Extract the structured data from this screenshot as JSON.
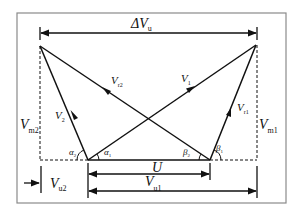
{
  "diagram": {
    "labels": {
      "delta_vu": "ΔV",
      "delta_vu_sub": "u",
      "vr2": "V",
      "vr2_sub": "r2",
      "v1": "V",
      "v1_sub": "1",
      "v2": "V",
      "v2_sub": "2",
      "vr1": "V",
      "vr1_sub": "r1",
      "vm2": "V",
      "vm2_sub": "m2",
      "vm1": "V",
      "vm1_sub": "m1",
      "alpha2": "α",
      "alpha2_sub": "2",
      "alpha1": "α",
      "alpha1_sub": "1",
      "beta2": "β",
      "beta2_sub": "2",
      "beta1": "β",
      "beta1_sub": "1",
      "u": "U",
      "vu1": "V",
      "vu1_sub": "u1",
      "vu2": "V",
      "vu2_sub": "u2"
    },
    "colors": {
      "line": "#111111",
      "border": "#8a8a8a",
      "background": "#ffffff"
    }
  }
}
